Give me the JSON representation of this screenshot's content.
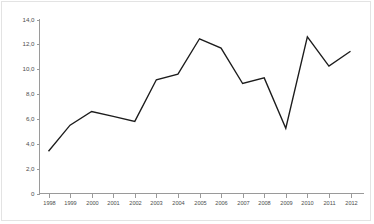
{
  "chart_data": {
    "type": "line",
    "title": "",
    "subtitle": "",
    "xlabel": "",
    "ylabel": "",
    "categories": [
      "1998",
      "1999",
      "2000",
      "2001",
      "2002",
      "2003",
      "2004",
      "2005",
      "2006",
      "2007",
      "2008",
      "2009",
      "2010",
      "2011",
      "2012"
    ],
    "values": [
      3.4,
      5.5,
      6.6,
      6.2,
      5.8,
      9.15,
      9.6,
      12.45,
      11.7,
      8.85,
      9.3,
      5.25,
      12.6,
      10.25,
      11.45
    ],
    "series": [
      {
        "name": "",
        "values": [
          3.4,
          5.5,
          6.6,
          6.2,
          5.8,
          9.15,
          9.6,
          12.45,
          11.7,
          8.85,
          9.3,
          5.25,
          12.6,
          10.25,
          11.45
        ]
      }
    ],
    "x_tick_labels": [
      "1998",
      "1999",
      "2000",
      "2001",
      "2002",
      "2003",
      "2004",
      "2005",
      "2006",
      "2007",
      "2008",
      "2009",
      "2010",
      "2011",
      "2012"
    ],
    "y_tick_labels": [
      "14,0",
      "12,0",
      "10,0",
      "8,0",
      "6,0",
      "4,0",
      "2,0",
      "0"
    ],
    "y_tick_values": [
      14.0,
      12.0,
      10.0,
      8.0,
      6.0,
      4.0,
      2.0,
      0
    ],
    "ylim": [
      0,
      14.0
    ],
    "xlim": [
      "1998",
      "2012"
    ],
    "grid": false,
    "legend": false,
    "legend_position": "none",
    "annotations": [],
    "line_color": "#1c1c1c",
    "axis_color": "#9a9a9a",
    "background_color": "#ffffff",
    "decimal_separator": ","
  }
}
